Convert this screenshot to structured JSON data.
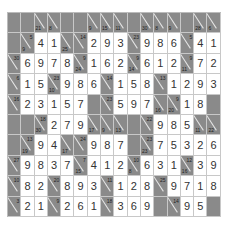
{
  "puzzle": {
    "type": "kakuro",
    "cols": 16,
    "rows": 10,
    "colors": {
      "block": "#8a8a8a",
      "cell": "#ffffff",
      "text": "#333333"
    },
    "grid": [
      [
        {
          "t": "b"
        },
        {
          "t": "b"
        },
        {
          "t": "c",
          "d": "21"
        },
        {
          "t": "c",
          "d": "8"
        },
        {
          "t": "b"
        },
        {
          "t": "b"
        },
        {
          "t": "c",
          "d": "9"
        },
        {
          "t": "c",
          "d": "15"
        },
        {
          "t": "c",
          "d": "11"
        },
        {
          "t": "b"
        },
        {
          "t": "c",
          "d": "30"
        },
        {
          "t": "c",
          "d": "8"
        },
        {
          "t": "c",
          "d": "9"
        },
        {
          "t": "b"
        },
        {
          "t": "c",
          "d": "28"
        },
        {
          "t": "c",
          "d": "6"
        }
      ],
      [
        {
          "t": "b"
        },
        {
          "t": "c",
          "d": "9",
          "r": "5"
        },
        {
          "t": "v",
          "v": "4"
        },
        {
          "t": "v",
          "v": "1"
        },
        {
          "t": "c",
          "d": "25"
        },
        {
          "t": "c",
          "r": "14"
        },
        {
          "t": "v",
          "v": "2"
        },
        {
          "t": "v",
          "v": "9"
        },
        {
          "t": "v",
          "v": "3"
        },
        {
          "t": "c",
          "r": "23"
        },
        {
          "t": "v",
          "v": "9"
        },
        {
          "t": "v",
          "v": "8"
        },
        {
          "t": "v",
          "v": "6"
        },
        {
          "t": "c",
          "r": "5"
        },
        {
          "t": "v",
          "v": "4"
        },
        {
          "t": "v",
          "v": "1"
        }
      ],
      [
        {
          "t": "c",
          "r": "30"
        },
        {
          "t": "v",
          "v": "6"
        },
        {
          "t": "v",
          "v": "9"
        },
        {
          "t": "v",
          "v": "7"
        },
        {
          "t": "v",
          "v": "8"
        },
        {
          "t": "c",
          "d": "24",
          "r": "9"
        },
        {
          "t": "v",
          "v": "1"
        },
        {
          "t": "v",
          "v": "6"
        },
        {
          "t": "v",
          "v": "2"
        },
        {
          "t": "c",
          "d": "14",
          "r": "9"
        },
        {
          "t": "v",
          "v": "6"
        },
        {
          "t": "v",
          "v": "1"
        },
        {
          "t": "v",
          "v": "2"
        },
        {
          "t": "c",
          "d": "11",
          "r": "9"
        },
        {
          "t": "v",
          "v": "7"
        },
        {
          "t": "v",
          "v": "2"
        }
      ],
      [
        {
          "t": "c",
          "r": "6"
        },
        {
          "t": "v",
          "v": "1"
        },
        {
          "t": "v",
          "v": "5"
        },
        {
          "t": "c",
          "d": "10",
          "r": "23"
        },
        {
          "t": "v",
          "v": "9"
        },
        {
          "t": "v",
          "v": "8"
        },
        {
          "t": "v",
          "v": "6"
        },
        {
          "t": "c",
          "r": "14"
        },
        {
          "t": "v",
          "v": "1"
        },
        {
          "t": "v",
          "v": "5"
        },
        {
          "t": "v",
          "v": "8"
        },
        {
          "t": "c",
          "r": "13"
        },
        {
          "t": "v",
          "v": "1"
        },
        {
          "t": "v",
          "v": "2"
        },
        {
          "t": "v",
          "v": "9"
        },
        {
          "t": "v",
          "v": "3"
        }
      ],
      [
        {
          "t": "c",
          "r": "16"
        },
        {
          "t": "v",
          "v": "2"
        },
        {
          "t": "v",
          "v": "3"
        },
        {
          "t": "v",
          "v": "1"
        },
        {
          "t": "v",
          "v": "5"
        },
        {
          "t": "v",
          "v": "7"
        },
        {
          "t": "b"
        },
        {
          "t": "c",
          "r": "23"
        },
        {
          "t": "v",
          "v": "5"
        },
        {
          "t": "v",
          "v": "9"
        },
        {
          "t": "v",
          "v": "7"
        },
        {
          "t": "c",
          "d": "16"
        },
        {
          "t": "c",
          "d": "20",
          "r": "9"
        },
        {
          "t": "v",
          "v": "1"
        },
        {
          "t": "v",
          "v": "8"
        },
        {
          "t": "b"
        }
      ],
      [
        {
          "t": "b"
        },
        {
          "t": "b"
        },
        {
          "t": "c",
          "d": "30",
          "r": "18"
        },
        {
          "t": "v",
          "v": "2"
        },
        {
          "t": "v",
          "v": "7"
        },
        {
          "t": "v",
          "v": "9"
        },
        {
          "t": "c",
          "d": "17"
        },
        {
          "t": "c",
          "d": "9"
        },
        {
          "t": "c",
          "d": "13"
        },
        {
          "t": "b"
        },
        {
          "t": "c",
          "r": "22"
        },
        {
          "t": "v",
          "v": "9"
        },
        {
          "t": "v",
          "v": "8"
        },
        {
          "t": "v",
          "v": "5"
        },
        {
          "t": "c",
          "d": "11"
        },
        {
          "t": "c",
          "d": "22"
        }
      ],
      [
        {
          "t": "b"
        },
        {
          "t": "c",
          "d": "19",
          "r": "13"
        },
        {
          "t": "v",
          "v": "9"
        },
        {
          "t": "v",
          "v": "4"
        },
        {
          "t": "c",
          "d": "17"
        },
        {
          "t": "c",
          "r": "24"
        },
        {
          "t": "v",
          "v": "9"
        },
        {
          "t": "v",
          "v": "8"
        },
        {
          "t": "v",
          "v": "7"
        },
        {
          "t": "b"
        },
        {
          "t": "c",
          "d": "23",
          "r": "23"
        },
        {
          "t": "v",
          "v": "7"
        },
        {
          "t": "v",
          "v": "5"
        },
        {
          "t": "v",
          "v": "3"
        },
        {
          "t": "v",
          "v": "2"
        },
        {
          "t": "v",
          "v": "6"
        }
      ],
      [
        {
          "t": "c",
          "r": "27"
        },
        {
          "t": "v",
          "v": "9"
        },
        {
          "t": "v",
          "v": "8"
        },
        {
          "t": "v",
          "v": "3"
        },
        {
          "t": "v",
          "v": "7"
        },
        {
          "t": "c",
          "d": "15",
          "r": "7"
        },
        {
          "t": "v",
          "v": "4"
        },
        {
          "t": "v",
          "v": "1"
        },
        {
          "t": "v",
          "v": "2"
        },
        {
          "t": "c",
          "d": "8",
          "r": "10"
        },
        {
          "t": "v",
          "v": "6"
        },
        {
          "t": "v",
          "v": "3"
        },
        {
          "t": "v",
          "v": "1"
        },
        {
          "t": "c",
          "d": "16",
          "r": "12"
        },
        {
          "t": "v",
          "v": "3"
        },
        {
          "t": "v",
          "v": "9"
        }
      ],
      [
        {
          "t": "c",
          "r": "10"
        },
        {
          "t": "v",
          "v": "8"
        },
        {
          "t": "v",
          "v": "2"
        },
        {
          "t": "c",
          "r": "20"
        },
        {
          "t": "v",
          "v": "8"
        },
        {
          "t": "v",
          "v": "9"
        },
        {
          "t": "v",
          "v": "3"
        },
        {
          "t": "c",
          "r": "11"
        },
        {
          "t": "v",
          "v": "1"
        },
        {
          "t": "v",
          "v": "2"
        },
        {
          "t": "v",
          "v": "8"
        },
        {
          "t": "c",
          "r": "25"
        },
        {
          "t": "v",
          "v": "9"
        },
        {
          "t": "v",
          "v": "7"
        },
        {
          "t": "v",
          "v": "1"
        },
        {
          "t": "v",
          "v": "8"
        }
      ],
      [
        {
          "t": "c",
          "r": "3"
        },
        {
          "t": "v",
          "v": "2"
        },
        {
          "t": "v",
          "v": "1"
        },
        {
          "t": "c",
          "r": "9"
        },
        {
          "t": "v",
          "v": "2"
        },
        {
          "t": "v",
          "v": "6"
        },
        {
          "t": "v",
          "v": "1"
        },
        {
          "t": "c",
          "r": "18"
        },
        {
          "t": "v",
          "v": "3"
        },
        {
          "t": "v",
          "v": "6"
        },
        {
          "t": "v",
          "v": "9"
        },
        {
          "t": "b"
        },
        {
          "t": "c",
          "r": "14"
        },
        {
          "t": "v",
          "v": "9"
        },
        {
          "t": "v",
          "v": "5"
        },
        {
          "t": "b"
        }
      ]
    ]
  }
}
